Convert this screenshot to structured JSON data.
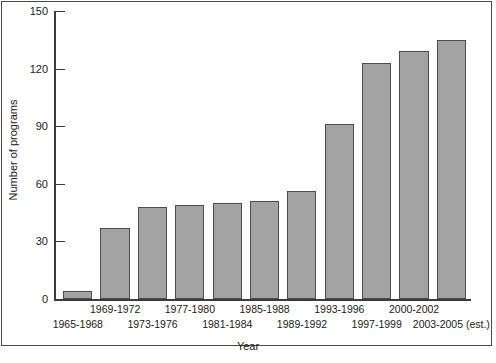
{
  "chart_data": {
    "type": "bar",
    "title": "",
    "xlabel": "Year",
    "ylabel": "Number of programs",
    "categories": [
      "1965-1968",
      "1969-1972",
      "1973-1976",
      "1977-1980",
      "1981-1984",
      "1985-1988",
      "1989-1992",
      "1993-1996",
      "1997-1999",
      "2000-2002",
      "2003-2005 (est.)"
    ],
    "values": [
      4,
      37,
      48,
      49,
      50,
      51,
      56,
      91,
      123,
      129,
      135
    ],
    "ylim": [
      0,
      150
    ],
    "yticks": [
      0,
      30,
      60,
      90,
      120,
      150
    ],
    "ytick_labels": [
      "0",
      "30",
      "60",
      "90",
      "120",
      "150"
    ],
    "grid": false,
    "legend": false,
    "bar_color": "#a3a3a3",
    "bar_edge_color": "#4d4d4d",
    "axis_color": "#3b3b3b",
    "label_stagger_rows": [
      1,
      0,
      1,
      0,
      1,
      0,
      1,
      0,
      1,
      0,
      1
    ]
  }
}
